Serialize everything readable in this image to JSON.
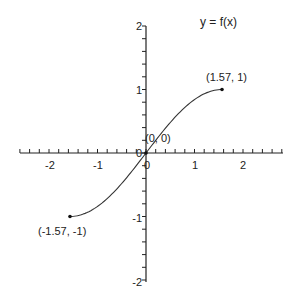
{
  "chart_data": {
    "type": "line",
    "title": "y = f(x)",
    "xlabel": "",
    "ylabel": "",
    "xlim": [
      -2.6,
      2.8
    ],
    "ylim": [
      -2,
      2
    ],
    "grid": false,
    "legend": null,
    "x_ticks": [
      -2,
      -1,
      0,
      1,
      2
    ],
    "x_tick_labels": [
      "-2",
      "-1",
      "0",
      "1",
      "2"
    ],
    "y_ticks": [
      -2,
      -1,
      0,
      1,
      2
    ],
    "y_tick_labels": [
      "-2",
      "-1",
      "0",
      "1",
      "2"
    ],
    "series": [
      {
        "name": "f(x) = sin(x)",
        "x": [
          -1.57,
          -1.2,
          -0.8,
          -0.4,
          0,
          0.4,
          0.8,
          1.2,
          1.57
        ],
        "y": [
          -1,
          -0.93,
          -0.72,
          -0.39,
          0,
          0.39,
          0.72,
          0.93,
          1
        ]
      }
    ],
    "annotations": [
      {
        "text": "(1.57, 1)",
        "x": 1.57,
        "y": 1
      },
      {
        "text": "(0, 0)",
        "x": 0,
        "y": 0
      },
      {
        "text": "(-1.57, -1)",
        "x": -1.57,
        "y": -1
      }
    ],
    "colors": {
      "axis": "#222222",
      "curve": "#333333",
      "background": "#ffffff"
    }
  }
}
